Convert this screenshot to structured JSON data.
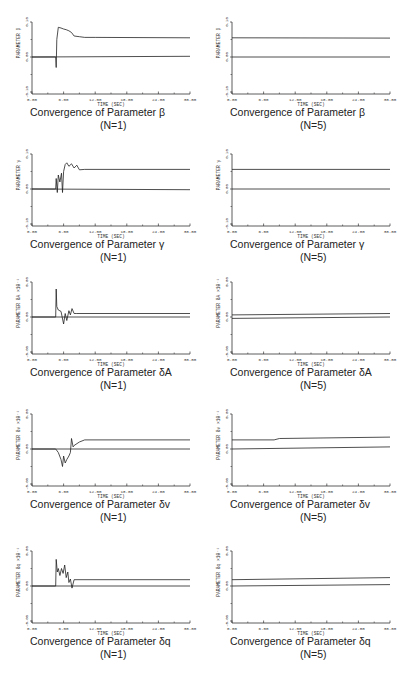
{
  "chart_data": [
    {
      "type": "line",
      "param": "β",
      "title": "Convergence of Parameter β",
      "n_label": "(N=1)",
      "xlabel": "TIME (SEC)",
      "ylabel": "PARAMETER β",
      "yscale_note": "",
      "xlim": [
        0,
        30
      ],
      "ylim": [
        -0.1,
        0.1
      ],
      "xticks": [
        "0.00",
        "6.00",
        "12.00",
        "18.00",
        "24.00",
        "30.00"
      ],
      "yticks": [
        "-0.10",
        "0.00",
        "0.10"
      ],
      "series": [
        {
          "name": "estimate",
          "x": [
            0,
            4.5,
            4.6,
            4.7,
            5,
            5.5,
            6,
            6.5,
            7,
            7.5,
            8,
            9,
            10,
            12,
            30
          ],
          "y": [
            0,
            0,
            -0.03,
            0.05,
            0.085,
            0.083,
            0.08,
            0.078,
            0.075,
            0.07,
            0.06,
            0.058,
            0.056,
            0.056,
            0.055
          ]
        },
        {
          "name": "reference",
          "x": [
            0,
            30
          ],
          "y": [
            0,
            0.002
          ]
        }
      ]
    },
    {
      "type": "line",
      "param": "β",
      "title": "Convergence of Parameter β",
      "n_label": "(N=5)",
      "xlabel": "TIME (SEC)",
      "ylabel": "PARAMETER β",
      "yscale_note": "",
      "xlim": [
        0,
        30
      ],
      "ylim": [
        -0.1,
        0.1
      ],
      "xticks": [
        "0.00",
        "6.00",
        "12.00",
        "18.00",
        "24.00",
        "30.00"
      ],
      "yticks": [
        "-0.10",
        "0.00",
        "0.10"
      ],
      "series": [
        {
          "name": "estimate",
          "x": [
            0,
            30
          ],
          "y": [
            0.055,
            0.054
          ]
        },
        {
          "name": "reference",
          "x": [
            0,
            30
          ],
          "y": [
            0,
            0
          ]
        }
      ]
    },
    {
      "type": "line",
      "param": "γ",
      "title": "Convergence of Parameter γ",
      "n_label": "(N=1)",
      "xlabel": "TIME (SEC)",
      "ylabel": "PARAMETER γ",
      "yscale_note": "",
      "xlim": [
        0,
        30
      ],
      "ylim": [
        -0.1,
        0.1
      ],
      "xticks": [
        "0.00",
        "6.00",
        "12.00",
        "18.00",
        "24.00",
        "30.00"
      ],
      "yticks": [
        "-0.10",
        "0.00",
        "0.10"
      ],
      "series": [
        {
          "name": "estimate",
          "x": [
            0,
            4.5,
            4.6,
            4.8,
            5,
            5.3,
            5.6,
            5.8,
            6,
            6.3,
            6.6,
            7,
            7.5,
            8,
            8.5,
            9,
            10,
            30
          ],
          "y": [
            0,
            0,
            0.03,
            -0.01,
            0.04,
            0.02,
            0.045,
            -0.01,
            0.05,
            0.07,
            0.075,
            0.065,
            0.072,
            0.06,
            0.068,
            0.055,
            0.056,
            0.056
          ]
        },
        {
          "name": "reference",
          "x": [
            0,
            30
          ],
          "y": [
            0,
            -0.002
          ]
        }
      ]
    },
    {
      "type": "line",
      "param": "γ",
      "title": "Convergence of Parameter γ",
      "n_label": "(N=5)",
      "xlabel": "TIME (SEC)",
      "ylabel": "PARAMETER γ",
      "yscale_note": "",
      "xlim": [
        0,
        30
      ],
      "ylim": [
        -0.1,
        0.1
      ],
      "xticks": [
        "0.00",
        "6.00",
        "12.00",
        "18.00",
        "24.00",
        "30.00"
      ],
      "yticks": [
        "-0.10",
        "0.00",
        "0.10"
      ],
      "series": [
        {
          "name": "estimate",
          "x": [
            0,
            30
          ],
          "y": [
            0.056,
            0.056
          ]
        },
        {
          "name": "reference",
          "x": [
            0,
            30
          ],
          "y": [
            0,
            0
          ]
        }
      ]
    },
    {
      "type": "line",
      "param": "δA",
      "title": "Convergence of Parameter δA",
      "n_label": "(N=1)",
      "xlabel": "TIME (SEC)",
      "ylabel": "PARAMETER δA ×10⁻¹",
      "yscale_note": "×10⁻¹",
      "xlim": [
        0,
        30
      ],
      "ylim": [
        -5,
        5
      ],
      "xticks": [
        "0.00",
        "6.00",
        "12.00",
        "18.00",
        "24.00",
        "30.00"
      ],
      "yticks": [
        "-5.00",
        "0.00",
        "5.00"
      ],
      "series": [
        {
          "name": "estimate",
          "x": [
            0,
            4.5,
            4.6,
            4.7,
            5,
            5.5,
            6,
            6.3,
            6.6,
            7,
            7.3,
            7.6,
            8,
            8.5,
            30
          ],
          "y": [
            0,
            0,
            4,
            1.5,
            1,
            0.8,
            -1,
            0.5,
            -0.5,
            0.9,
            0.3,
            1.2,
            0.5,
            0.5,
            0.5
          ]
        },
        {
          "name": "reference",
          "x": [
            0,
            30
          ],
          "y": [
            0,
            0
          ]
        }
      ]
    },
    {
      "type": "line",
      "param": "δA",
      "title": "Convergence of Parameter δA",
      "n_label": "(N=5)",
      "xlabel": "TIME (SEC)",
      "ylabel": "PARAMETER δA ×10⁻¹",
      "yscale_note": "×10⁻¹",
      "xlim": [
        0,
        30
      ],
      "ylim": [
        -5,
        5
      ],
      "xticks": [
        "0.00",
        "6.00",
        "12.00",
        "18.00",
        "24.00",
        "30.00"
      ],
      "yticks": [
        "-5.00",
        "0.00",
        "5.00"
      ],
      "series": [
        {
          "name": "estimate",
          "x": [
            0,
            30
          ],
          "y": [
            0.3,
            0.5
          ]
        },
        {
          "name": "reference",
          "x": [
            0,
            30
          ],
          "y": [
            -0.2,
            0
          ]
        }
      ]
    },
    {
      "type": "line",
      "param": "δv",
      "title": "Convergence of Parameter δv",
      "n_label": "(N=1)",
      "xlabel": "TIME (SEC)",
      "ylabel": "PARAMETER δv ×10⁻¹",
      "yscale_note": "×10⁻¹",
      "xlim": [
        0,
        30
      ],
      "ylim": [
        -5,
        5
      ],
      "xticks": [
        "0.00",
        "6.00",
        "12.00",
        "18.00",
        "24.00",
        "30.00"
      ],
      "yticks": [
        "-5.00",
        "0.00",
        "5.00"
      ],
      "series": [
        {
          "name": "estimate",
          "x": [
            0,
            4.5,
            5,
            5.5,
            5.8,
            6,
            6.3,
            6.6,
            7,
            7.3,
            7.5,
            7.8,
            8,
            9,
            10,
            30
          ],
          "y": [
            0,
            0,
            -0.5,
            -1.5,
            -2.5,
            -1,
            -2,
            -1.5,
            -1,
            -0.5,
            1.5,
            0.3,
            0.5,
            1,
            1.3,
            1.3
          ]
        },
        {
          "name": "reference",
          "x": [
            0,
            30
          ],
          "y": [
            0,
            0
          ]
        }
      ]
    },
    {
      "type": "line",
      "param": "δv",
      "title": "Convergence of Parameter δv",
      "n_label": "(N=5)",
      "xlabel": "TIME (SEC)",
      "ylabel": "PARAMETER δv ×10⁻¹",
      "yscale_note": "×10⁻¹",
      "xlim": [
        0,
        30
      ],
      "ylim": [
        -5,
        5
      ],
      "xticks": [
        "0.00",
        "6.00",
        "12.00",
        "18.00",
        "24.00",
        "30.00"
      ],
      "yticks": [
        "-5.00",
        "0.00",
        "5.00"
      ],
      "series": [
        {
          "name": "estimate",
          "x": [
            0,
            8,
            9,
            30
          ],
          "y": [
            1.3,
            1.3,
            1.5,
            1.7
          ]
        },
        {
          "name": "reference",
          "x": [
            0,
            30
          ],
          "y": [
            0,
            0.3
          ]
        }
      ]
    },
    {
      "type": "line",
      "param": "δq",
      "title": "Convergence of Parameter δq",
      "n_label": "(N=1)",
      "xlabel": "TIME (SEC)",
      "ylabel": "PARAMETER δq ×10⁻¹",
      "yscale_note": "×10⁻¹",
      "xlim": [
        0,
        30
      ],
      "ylim": [
        -5,
        5
      ],
      "xticks": [
        "0.00",
        "6.00",
        "12.00",
        "18.00",
        "24.00",
        "30.00"
      ],
      "yticks": [
        "-5.00",
        "0.00",
        "5.00"
      ],
      "series": [
        {
          "name": "estimate",
          "x": [
            0,
            4.5,
            4.6,
            4.8,
            5,
            5.3,
            5.6,
            5.9,
            6.2,
            6.5,
            6.8,
            7,
            7.3,
            7.6,
            8,
            30
          ],
          "y": [
            0,
            0,
            3.8,
            2,
            2.5,
            1.5,
            2.5,
            1.8,
            3,
            1.2,
            2,
            0.5,
            1,
            -0.3,
            0.9,
            0.9
          ]
        },
        {
          "name": "reference",
          "x": [
            0,
            30
          ],
          "y": [
            0,
            0
          ]
        }
      ]
    },
    {
      "type": "line",
      "param": "δq",
      "title": "Convergence of Parameter δq",
      "n_label": "(N=5)",
      "xlabel": "TIME (SEC)",
      "ylabel": "PARAMETER δq ×10⁻¹",
      "yscale_note": "×10⁻¹",
      "xlim": [
        0,
        30
      ],
      "ylim": [
        -5,
        5
      ],
      "xticks": [
        "0.00",
        "6.00",
        "12.00",
        "18.00",
        "24.00",
        "30.00"
      ],
      "yticks": [
        "-5.00",
        "0.00",
        "5.00"
      ],
      "series": [
        {
          "name": "estimate",
          "x": [
            0,
            30
          ],
          "y": [
            0.9,
            1.2
          ]
        },
        {
          "name": "reference",
          "x": [
            0,
            30
          ],
          "y": [
            0,
            0.2
          ]
        }
      ]
    }
  ]
}
